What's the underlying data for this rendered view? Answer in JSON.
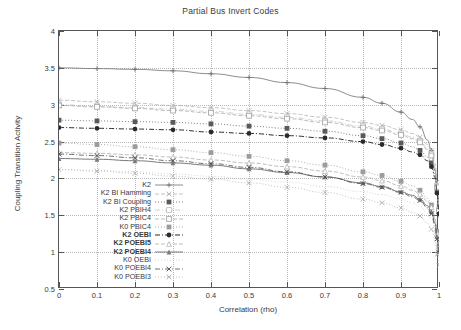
{
  "chart_data": {
    "type": "line",
    "title": "Partial Bus Invert Codes",
    "xlabel": "Correlation (rho)",
    "ylabel": "Coupling Transition Activity",
    "xlim": [
      0,
      1
    ],
    "ylim": [
      0.5,
      4
    ],
    "xticks": [
      "0",
      "0.1",
      "0.2",
      "0.3",
      "0.4",
      "0.5",
      "0.6",
      "0.7",
      "0.8",
      "0.9",
      "1"
    ],
    "yticks": [
      "0.5",
      "1",
      "1.5",
      "2",
      "2.5",
      "3",
      "3.5",
      "4"
    ],
    "grid": true,
    "legend_position": "inside-lower-left",
    "x": [
      0,
      0.1,
      0.2,
      0.3,
      0.4,
      0.5,
      0.6,
      0.7,
      0.8,
      0.85,
      0.9,
      0.93,
      0.95,
      0.97,
      0.98,
      0.99,
      0.995,
      1
    ],
    "series": [
      {
        "name": "K2",
        "color": "#6f6f6f",
        "marker": "plus",
        "dash": "solid",
        "bold": false,
        "values": [
          3.5,
          3.49,
          3.48,
          3.46,
          3.42,
          3.37,
          3.3,
          3.22,
          3.1,
          3.02,
          2.9,
          2.8,
          2.7,
          2.52,
          2.38,
          2.1,
          1.8,
          1.5
        ]
      },
      {
        "name": "K2 BI Hamming",
        "color": "#b5b5b5",
        "marker": "cross",
        "dash": "dash",
        "bold": false,
        "values": [
          3.06,
          3.04,
          3.02,
          2.99,
          2.96,
          2.92,
          2.88,
          2.83,
          2.76,
          2.72,
          2.66,
          2.61,
          2.56,
          2.46,
          2.38,
          2.2,
          1.95,
          1.62
        ]
      },
      {
        "name": "K2 BI Coupling",
        "color": "#5a5a5a",
        "marker": "fsquare",
        "dash": "dot",
        "bold": false,
        "values": [
          2.79,
          2.78,
          2.77,
          2.76,
          2.74,
          2.71,
          2.68,
          2.64,
          2.58,
          2.54,
          2.48,
          2.43,
          2.38,
          2.29,
          2.21,
          2.05,
          1.84,
          1.55
        ]
      },
      {
        "name": "K2 PBIH4",
        "color": "#c4c4c4",
        "marker": "osquare",
        "dash": "dashdot",
        "bold": false,
        "values": [
          3.0,
          2.98,
          2.96,
          2.94,
          2.91,
          2.87,
          2.83,
          2.78,
          2.71,
          2.67,
          2.61,
          2.56,
          2.51,
          2.41,
          2.33,
          2.15,
          1.9,
          1.58
        ]
      },
      {
        "name": "K2 PBIC4",
        "color": "#aaaaaa",
        "marker": "osquare",
        "dash": "dash",
        "bold": false,
        "values": [
          2.99,
          2.97,
          2.95,
          2.92,
          2.89,
          2.85,
          2.81,
          2.76,
          2.69,
          2.65,
          2.59,
          2.54,
          2.49,
          2.39,
          2.31,
          2.13,
          1.88,
          1.56
        ]
      },
      {
        "name": "K0 PBIC4",
        "color": "#9c9c9c",
        "marker": "fsquare",
        "dash": "dot",
        "bold": false,
        "values": [
          2.48,
          2.46,
          2.43,
          2.39,
          2.35,
          2.3,
          2.24,
          2.18,
          2.09,
          2.04,
          1.96,
          1.9,
          1.84,
          1.73,
          1.64,
          1.46,
          1.28,
          1.08
        ]
      },
      {
        "name": "K2 OEBI",
        "color": "#2b2b2b",
        "marker": "fcircle",
        "dash": "dashdot",
        "bold": true,
        "values": [
          2.69,
          2.68,
          2.67,
          2.66,
          2.63,
          2.61,
          2.58,
          2.55,
          2.5,
          2.46,
          2.41,
          2.36,
          2.32,
          2.24,
          2.16,
          2.01,
          1.8,
          1.52
        ]
      },
      {
        "name": "K2 POEBI5",
        "color": "#bdbdbd",
        "marker": "triangle",
        "dash": "dash",
        "bold": true,
        "values": [
          2.35,
          2.34,
          2.32,
          2.29,
          2.25,
          2.21,
          2.16,
          2.1,
          2.02,
          1.97,
          1.9,
          1.84,
          1.79,
          1.69,
          1.61,
          1.44,
          1.25,
          1.05
        ]
      },
      {
        "name": "K2 POEBI4",
        "color": "#7a7a7a",
        "marker": "ftriangle",
        "dash": "solid",
        "bold": true,
        "values": [
          2.27,
          2.26,
          2.24,
          2.21,
          2.18,
          2.13,
          2.08,
          2.02,
          1.94,
          1.89,
          1.82,
          1.77,
          1.72,
          1.63,
          1.55,
          1.39,
          1.21,
          1.02
        ]
      },
      {
        "name": "K0 OEBI",
        "color": "#c9c9c9",
        "marker": "none",
        "dash": "dot",
        "bold": false,
        "values": [
          2.12,
          2.11,
          2.09,
          2.06,
          2.03,
          1.99,
          1.95,
          1.89,
          1.82,
          1.78,
          1.72,
          1.67,
          1.62,
          1.53,
          1.46,
          1.31,
          1.14,
          0.96
        ]
      },
      {
        "name": "K0 POEBI4",
        "color": "#4a4a4a",
        "marker": "cross",
        "dash": "dashdot",
        "bold": false,
        "values": [
          2.33,
          2.31,
          2.28,
          2.24,
          2.2,
          2.15,
          2.09,
          2.02,
          1.93,
          1.88,
          1.81,
          1.75,
          1.7,
          1.6,
          1.52,
          1.36,
          1.18,
          0.99
        ]
      },
      {
        "name": "K0 POEBI3",
        "color": "#b0b0b0",
        "marker": "cross",
        "dash": "dot",
        "bold": false,
        "values": [
          2.12,
          2.1,
          2.07,
          2.03,
          1.99,
          1.94,
          1.88,
          1.81,
          1.72,
          1.67,
          1.6,
          1.54,
          1.49,
          1.39,
          1.31,
          1.15,
          0.97,
          0.82
        ]
      }
    ]
  }
}
